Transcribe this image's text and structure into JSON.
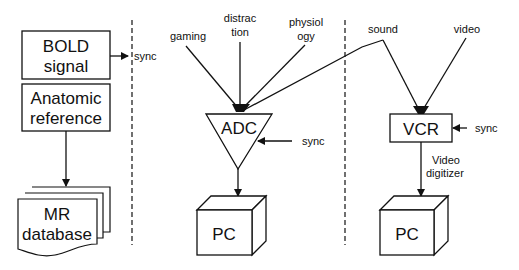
{
  "left_panel": {
    "bold_box": {
      "line1": "BOLD",
      "line2": "signal"
    },
    "sync_label": "sync",
    "anatomic_box": {
      "line1": "Anatomic",
      "line2": "reference"
    },
    "mr_database": {
      "line1": "MR",
      "line2": "database"
    }
  },
  "middle_panel": {
    "inputs": {
      "gaming": "gaming",
      "distraction": {
        "line1": "distrac",
        "line2": "tion"
      },
      "physiology": {
        "line1": "physiol",
        "line2": "ogy"
      }
    },
    "adc_label": "ADC",
    "sync_label": "sync",
    "pc_label": "PC"
  },
  "right_panel": {
    "inputs": {
      "sound": "sound",
      "video": "video"
    },
    "vcr_label": "VCR",
    "sync_label": "sync",
    "digitizer": {
      "line1": "Video",
      "line2": "digitizer"
    },
    "pc_label": "PC"
  },
  "colors": {
    "stroke": "#111111",
    "background": "#ffffff"
  }
}
